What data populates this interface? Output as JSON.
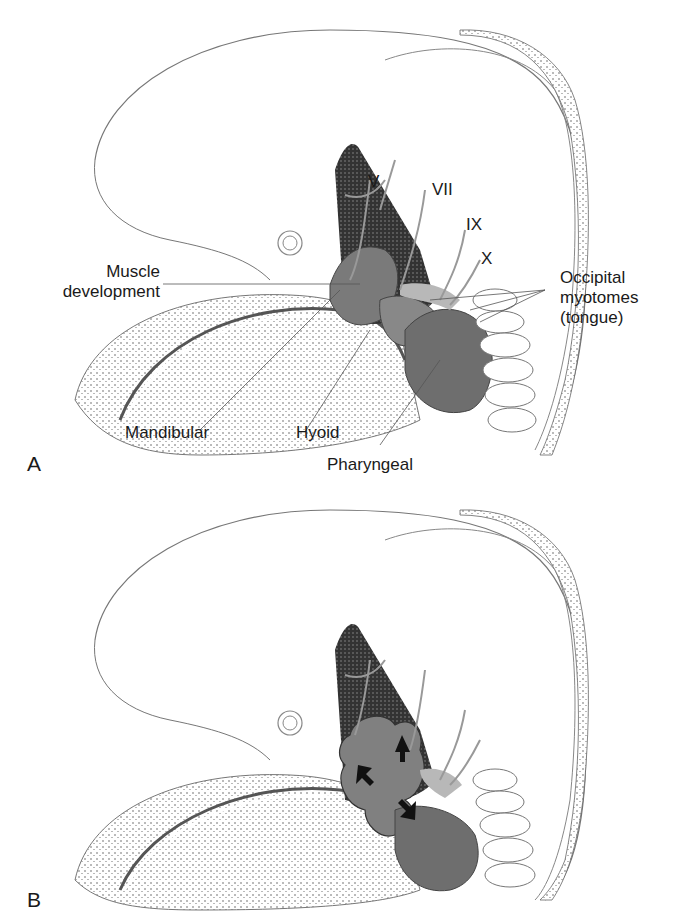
{
  "figure": {
    "panels": [
      {
        "letter": "A",
        "labels": {
          "muscle_development": [
            "Muscle",
            "development"
          ],
          "occipital_myotomes": [
            "Occipital",
            "myotomes",
            "(tongue)"
          ],
          "mandibular": "Mandibular",
          "hyoid": "Hyoid",
          "pharyngeal": "Pharyngeal"
        },
        "nerves": [
          "V",
          "VII",
          "IX",
          "X"
        ]
      },
      {
        "letter": "B"
      }
    ],
    "colors": {
      "muscle_gray": "#7a7a7a",
      "light_gray": "#b8b8b8",
      "dark_stipple": "#2a2a2a",
      "outline": "#555555"
    }
  }
}
